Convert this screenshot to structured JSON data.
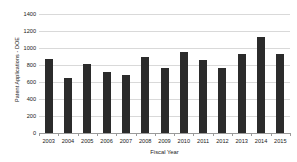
{
  "chart_data": {
    "type": "bar",
    "title": "",
    "xlabel": "Fiscal Year",
    "ylabel": "Patent Applications - DOE",
    "categories": [
      "2003",
      "2004",
      "2005",
      "2006",
      "2007",
      "2008",
      "2009",
      "2010",
      "2011",
      "2012",
      "2013",
      "2014",
      "2015"
    ],
    "values": [
      865,
      650,
      815,
      720,
      685,
      900,
      765,
      955,
      855,
      765,
      930,
      1130,
      930
    ],
    "series": [
      {
        "name": "Patent Applications - DOE",
        "values": [
          865,
          650,
          815,
          720,
          685,
          900,
          765,
          955,
          855,
          765,
          930,
          1130,
          930
        ]
      }
    ],
    "ylim": [
      0,
      1400
    ],
    "y_ticks": [
      0,
      200,
      400,
      600,
      800,
      1000,
      1200,
      1400
    ],
    "y_tick_labels": [
      "0",
      "200",
      "400",
      "600",
      "800",
      "1000",
      "1200",
      "1400"
    ],
    "grid": true,
    "legend": false,
    "legend_position": "none",
    "bar_color": "#2b2b2b",
    "grid_color": "#d9d9d9",
    "axis_color": "#9a9a9a",
    "background_color": "#ffffff",
    "text_color": "#1a1a1a"
  }
}
